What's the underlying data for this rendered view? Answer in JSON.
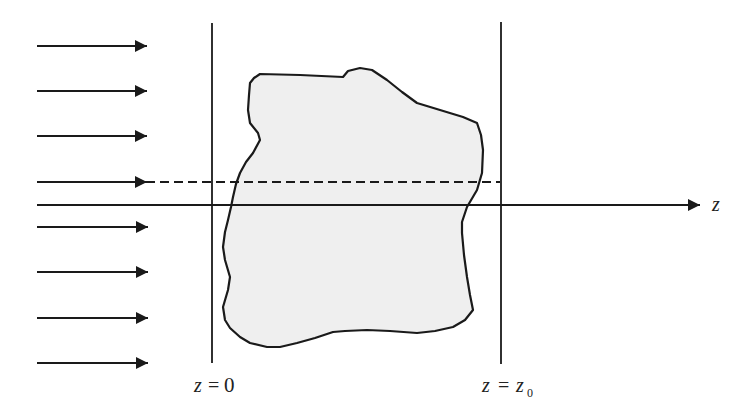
{
  "diagram": {
    "type": "physics-scattering-schematic",
    "colors": {
      "stroke": "#1a1a1a",
      "object_fill": "#efefef",
      "background": "#ffffff"
    },
    "axis": {
      "label": "z"
    },
    "planes": [
      {
        "id": "plane-left",
        "label_var": "z",
        "label_eq": "=",
        "label_val": "0",
        "label_sub": ""
      },
      {
        "id": "plane-right",
        "label_var": "z",
        "label_eq": "=",
        "label_val": "z",
        "label_sub": "0"
      }
    ],
    "incident_arrows": {
      "count": 8,
      "rows_y": [
        46,
        91,
        136,
        182,
        227,
        272,
        318,
        363
      ]
    },
    "ray": {
      "style": "dashed",
      "row_index": 3
    },
    "object": {
      "name": "irregular scatterer",
      "fill": "light gray"
    }
  }
}
